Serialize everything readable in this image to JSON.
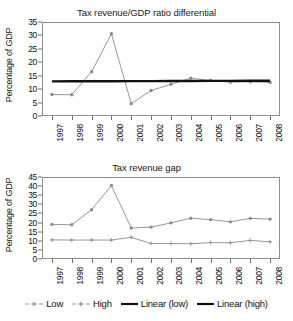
{
  "figure": {
    "ylabel": "Percentage of GDP",
    "legend": [
      {
        "label": "Low",
        "style": "marker-line",
        "color": "#8c8c8c"
      },
      {
        "label": "High",
        "style": "marker-line",
        "color": "#8c8c8c"
      },
      {
        "label": "Linear (low)",
        "style": "solid-thick",
        "color": "#111111"
      },
      {
        "label": "Linear (high)",
        "style": "solid-thick",
        "color": "#111111"
      }
    ]
  },
  "chart_data": [
    {
      "type": "line",
      "title": "Tax revenue/GDP ratio differential",
      "xlabel": "",
      "ylabel": "Percentage of GDP",
      "x": [
        "1997",
        "1998",
        "1999",
        "2000",
        "2001",
        "2002",
        "2003",
        "2004",
        "2005",
        "2006",
        "2007",
        "2008"
      ],
      "ylim": [
        0,
        35
      ],
      "yticks": [
        0,
        5,
        10,
        15,
        20,
        25,
        30,
        35
      ],
      "grid": false,
      "legend_position": "figure-bottom",
      "series": [
        {
          "name": "Low",
          "color": "#8c8c8c",
          "marker": "circle",
          "values": [
            8.0,
            7.9,
            16.5,
            30.6,
            4.6,
            9.5,
            11.8,
            14.1,
            13.2,
            12.6,
            12.7,
            12.5
          ]
        },
        {
          "name": "Linear (low)",
          "color": "#111111",
          "marker": "none",
          "trend": true,
          "values": [
            12.9,
            12.92,
            12.94,
            12.96,
            12.98,
            13.0,
            13.02,
            13.04,
            13.06,
            13.08,
            13.1,
            13.12
          ]
        }
      ]
    },
    {
      "type": "line",
      "title": "Tax revenue gap",
      "xlabel": "",
      "ylabel": "Percentage of GDP",
      "x": [
        "1997",
        "1998",
        "1999",
        "2000",
        "2001",
        "2002",
        "2003",
        "2004",
        "2005",
        "2006",
        "2007",
        "2008"
      ],
      "ylim": [
        0,
        45
      ],
      "yticks": [
        0,
        5,
        10,
        15,
        20,
        25,
        30,
        35,
        40,
        45
      ],
      "grid": false,
      "legend_position": "figure-bottom",
      "series": [
        {
          "name": "High",
          "color": "#8c8c8c",
          "marker": "circle",
          "values": [
            19.0,
            18.8,
            27.0,
            40.3,
            17.0,
            17.5,
            19.8,
            22.4,
            21.6,
            20.4,
            22.3,
            21.9
          ]
        },
        {
          "name": "Low",
          "color": "#8c8c8c",
          "marker": "cross",
          "values": [
            10.5,
            10.4,
            10.4,
            10.4,
            11.9,
            8.5,
            8.5,
            8.4,
            9.0,
            8.9,
            10.2,
            9.4
          ]
        }
      ]
    }
  ]
}
